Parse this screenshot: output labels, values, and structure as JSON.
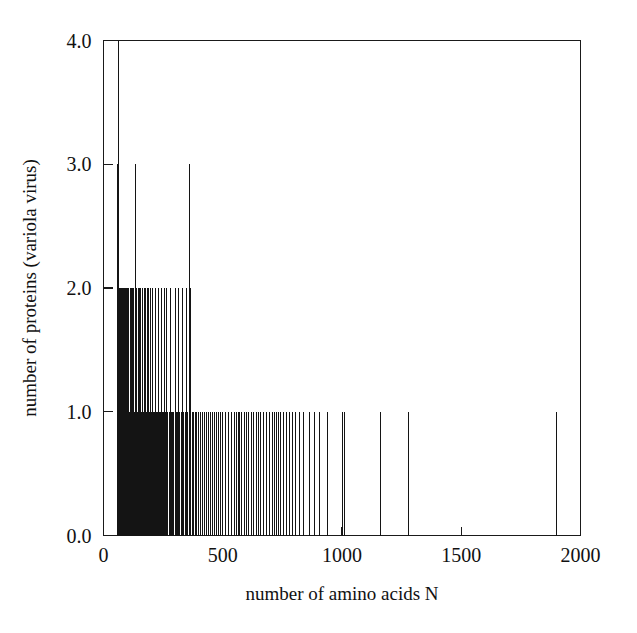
{
  "figure": {
    "background_color": "#ffffff",
    "line_color": "#141414",
    "text_color": "#111111"
  },
  "chart_data": {
    "type": "bar",
    "subtype": "impulse-spike-histogram",
    "title": "",
    "subtitle": "",
    "xlabel": "number of amino acids N",
    "ylabel": "number of proteins (variola virus)",
    "xlim": [
      0,
      2000
    ],
    "ylim": [
      0,
      4
    ],
    "xticks": [
      0,
      500,
      1000,
      1500,
      2000
    ],
    "xtick_labels": [
      "0",
      "500",
      "1000",
      "1500",
      "2000"
    ],
    "yticks": [
      0,
      1,
      2,
      3,
      4
    ],
    "ytick_labels": [
      "0.0",
      "1.0",
      "2.0",
      "3.0",
      "4.0"
    ],
    "grid": false,
    "legend": null,
    "legend_position": "none",
    "annotations": [],
    "x": [
      60,
      62,
      64,
      66,
      68,
      70,
      72,
      74,
      76,
      78,
      80,
      82,
      84,
      86,
      88,
      90,
      92,
      94,
      96,
      98,
      100,
      103,
      106,
      109,
      112,
      115,
      118,
      121,
      124,
      127,
      130,
      133,
      136,
      139,
      142,
      145,
      148,
      151,
      154,
      157,
      160,
      163,
      166,
      169,
      172,
      175,
      178,
      181,
      184,
      187,
      190,
      194,
      198,
      202,
      206,
      210,
      214,
      218,
      222,
      226,
      230,
      234,
      238,
      242,
      246,
      250,
      254,
      258,
      262,
      266,
      270,
      275,
      280,
      285,
      290,
      295,
      300,
      305,
      310,
      315,
      320,
      325,
      330,
      336,
      342,
      348,
      354,
      360,
      366,
      372,
      378,
      384,
      392,
      400,
      408,
      416,
      424,
      432,
      440,
      448,
      456,
      464,
      472,
      482,
      492,
      500,
      512,
      524,
      536,
      548,
      556,
      564,
      572,
      580,
      590,
      600,
      610,
      620,
      630,
      640,
      650,
      660,
      672,
      684,
      696,
      708,
      716,
      724,
      732,
      744,
      756,
      768,
      780,
      792,
      806,
      820,
      840,
      862,
      884,
      906,
      940,
      1000,
      1012,
      1160,
      1280,
      1900
    ],
    "y": [
      3,
      4,
      2,
      2,
      2,
      2,
      2,
      2,
      2,
      2,
      2,
      2,
      2,
      2,
      2,
      2,
      2,
      2,
      1,
      2,
      2,
      1,
      2,
      1,
      2,
      1,
      2,
      2,
      1,
      2,
      1,
      2,
      3,
      2,
      1,
      2,
      1,
      2,
      1,
      2,
      1,
      2,
      1,
      1,
      2,
      1,
      2,
      1,
      2,
      1,
      2,
      1,
      2,
      1,
      2,
      1,
      1,
      2,
      1,
      1,
      2,
      1,
      1,
      2,
      1,
      1,
      2,
      1,
      1,
      2,
      1,
      1,
      2,
      1,
      1,
      1,
      2,
      1,
      1,
      2,
      1,
      1,
      2,
      1,
      1,
      2,
      1,
      3,
      2,
      1,
      1,
      1,
      1,
      1,
      1,
      1,
      1,
      1,
      1,
      1,
      1,
      1,
      1,
      1,
      1,
      1,
      1,
      1,
      1,
      1,
      1,
      1,
      1,
      1,
      1,
      1,
      1,
      1,
      1,
      1,
      1,
      1,
      1,
      1,
      1,
      1,
      1,
      1,
      1,
      1,
      1,
      1,
      1,
      1,
      1,
      1,
      1,
      1,
      1,
      1,
      1,
      1,
      1,
      1,
      1,
      1
    ],
    "notes": {
      "max_count": 4,
      "max_count_N": 62,
      "peaks_at_3": [
        60,
        136,
        360
      ],
      "isolated_tail_spikes_N": [
        1000,
        1012,
        1160,
        1280,
        1900
      ],
      "dense_region_N_range": [
        60,
        800
      ]
    }
  },
  "axes": {
    "x_title": "number of amino acids N",
    "y_title": "number of proteins (variola virus)",
    "x_tick_labels": [
      "0",
      "500",
      "1000",
      "1500",
      "2000"
    ],
    "y_tick_labels": [
      "0.0",
      "1.0",
      "2.0",
      "3.0",
      "4.0"
    ]
  }
}
